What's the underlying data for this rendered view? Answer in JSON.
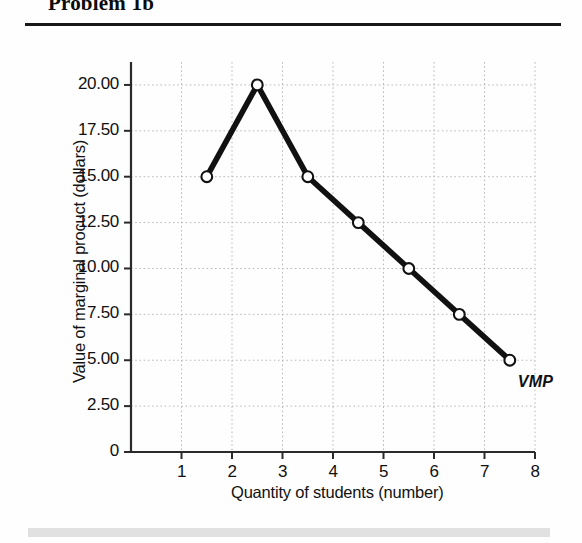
{
  "header": {
    "title": "Problem 1b"
  },
  "chart_data": {
    "type": "line",
    "title": "Problem 1b",
    "xlabel": "Quantity of students (number)",
    "ylabel": "Value of marginal procuct (dollars)",
    "xlim": [
      0,
      8
    ],
    "ylim": [
      0,
      21.25
    ],
    "grid": true,
    "legend": "none",
    "marker": "open-circle",
    "xticks": [
      "1",
      "2",
      "3",
      "4",
      "5",
      "6",
      "7",
      "8"
    ],
    "xtick_values": [
      1,
      2,
      3,
      4,
      5,
      6,
      7,
      8
    ],
    "yticks": [
      "0",
      "2.50",
      "5.00",
      "7.50",
      "10.00",
      "12.50",
      "15.00",
      "17.50",
      "20.00"
    ],
    "ytick_values": [
      0,
      2.5,
      5,
      7.5,
      10,
      12.5,
      15,
      17.5,
      20
    ],
    "series": [
      {
        "name": "VMP",
        "annotation": "VMP",
        "x": [
          1.5,
          2.5,
          3.5,
          4.5,
          5.5,
          6.5,
          7.5
        ],
        "values": [
          15.0,
          20.0,
          15.0,
          12.5,
          10.0,
          7.5,
          5.0
        ]
      }
    ],
    "colors": {
      "line": "#111111",
      "marker_fill": "#ffffff",
      "marker_stroke": "#111111",
      "axis": "#333333",
      "grid": "#b9b9b9"
    }
  }
}
